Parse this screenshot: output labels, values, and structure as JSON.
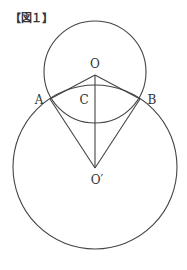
{
  "figure": {
    "title": "【図１】"
  },
  "diagram": {
    "points": {
      "O": "O",
      "O_prime": "O′",
      "A": "A",
      "B": "B",
      "C": "C"
    },
    "elements": [
      "small circle centered at O",
      "large circle centered at O′",
      "segment OO′ through C",
      "segments OA, OB",
      "segments O′A, O′B"
    ],
    "stroke_color": "#444444"
  }
}
